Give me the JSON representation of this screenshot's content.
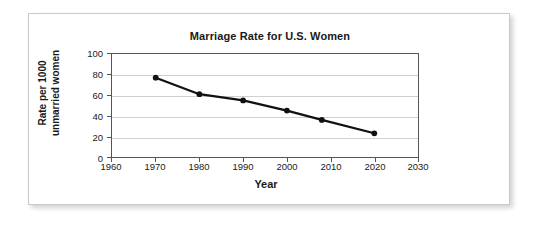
{
  "chart_data": {
    "type": "line",
    "title": "Marriage Rate for U.S. Women",
    "xlabel": "Year",
    "ylabel_line1": "Rate per 1000",
    "ylabel_line2": "unmarried women",
    "ylabel": "Rate per 1000 unmarried women",
    "x": [
      1970,
      1980,
      1990,
      2000,
      2008,
      2020
    ],
    "values": [
      77,
      61,
      55,
      45,
      36,
      23
    ],
    "series": [
      {
        "name": "Marriage rate",
        "values": [
          77,
          61,
          55,
          45,
          36,
          23
        ]
      }
    ],
    "xlim": [
      1960,
      2030
    ],
    "ylim": [
      0,
      100
    ],
    "xticks": [
      "1960",
      "1970",
      "1980",
      "1990",
      "2000",
      "2010",
      "2020",
      "2030"
    ],
    "xtick_values": [
      1960,
      1970,
      1980,
      1990,
      2000,
      2010,
      2020,
      2030
    ],
    "yticks": [
      "0",
      "20",
      "40",
      "60",
      "80",
      "100"
    ],
    "ytick_values": [
      0,
      20,
      40,
      60,
      80,
      100
    ],
    "grid": "horizontal",
    "legend": "none",
    "line_color": "#111111",
    "marker_color": "#111111",
    "grid_color": "#cfcfcf",
    "axis_color": "#555555",
    "background_color": "#ffffff"
  }
}
